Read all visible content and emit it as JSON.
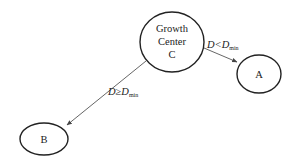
{
  "diagram": {
    "type": "node-link",
    "nodes": [
      {
        "id": "C",
        "lines": [
          "Growth",
          "Center",
          "C"
        ],
        "cx": 172,
        "cy": 42,
        "rx": 32,
        "ry": 30
      },
      {
        "id": "A",
        "lines": [
          "A"
        ],
        "cx": 259,
        "cy": 74,
        "rx": 22,
        "ry": 19
      },
      {
        "id": "B",
        "lines": [
          "B"
        ],
        "cx": 44,
        "cy": 139,
        "rx": 24,
        "ry": 16
      }
    ],
    "edges": [
      {
        "from": "C",
        "to": "A",
        "label_main": "D<D",
        "label_sub": "min"
      },
      {
        "from": "C",
        "to": "B",
        "label_main": "D≥D",
        "label_sub": "min"
      }
    ]
  },
  "colors": {
    "stroke": "#222222",
    "edge": "#555555",
    "background": "#ffffff"
  }
}
